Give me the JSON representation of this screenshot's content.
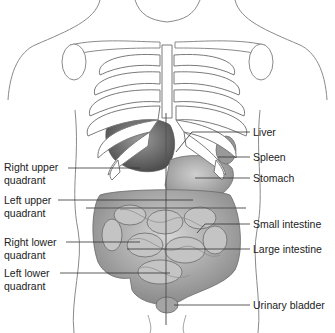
{
  "diagram": {
    "left_labels": [
      {
        "line1": "Right upper",
        "line2": "quadrant"
      },
      {
        "line1": "Left upper",
        "line2": "quadrant"
      },
      {
        "line1": "Right lower",
        "line2": "quadrant"
      },
      {
        "line1": "Left lower",
        "line2": "quadrant"
      }
    ],
    "right_labels": [
      {
        "text": "Liver"
      },
      {
        "text": "Spleen"
      },
      {
        "text": "Stomach"
      },
      {
        "text": "Small intestine"
      },
      {
        "text": "Large intestine"
      },
      {
        "text": "Urinary bladder"
      }
    ],
    "colors": {
      "outline": "#7a7a7a",
      "bone_fill": "#ffffff",
      "organ_dark": "#6e6e6e",
      "organ_mid": "#9c9c9c",
      "organ_light": "#c8c8c8",
      "leader_line": "#333333"
    }
  }
}
